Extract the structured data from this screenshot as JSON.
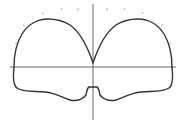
{
  "diagram": {
    "type": "closed-curve-on-axes",
    "colors": {
      "background": "#ffffff",
      "curve": "#333333",
      "axes": "#555555",
      "ticks": "#9a9a9a"
    },
    "axes": {
      "vertical": {
        "x": 93,
        "y1": 4,
        "y2": 120
      },
      "horizontal": {
        "y": 67,
        "x1": 10,
        "x2": 176
      }
    },
    "curve_path": "M93,63 C88,48 80,32 70,25 C62,20 55,19 48,19 C38,19 28,24 22,34 C16,44 14,56 14,67 C13,76 13,85 17,88 C22,92 34,91 45,92 C56,93 63,98 70,100 C78,102 84,98 86,95 C87,91 87,88 89,87 L97,87 C99,88 99,91 100,95 C102,98 108,102 116,100 C123,98 130,93 141,92 C152,91 164,92 169,88 C173,85 173,76 172,67 C172,56 170,44 164,34 C158,24 148,19 138,19 C131,19 124,20 116,25 C106,32 98,48 93,63 Z",
    "ticks": [
      {
        "x1": 15,
        "y1": 44,
        "x2": 17,
        "y2": 43
      },
      {
        "x1": 23,
        "y1": 25,
        "x2": 25,
        "y2": 26
      },
      {
        "x1": 42,
        "y1": 13,
        "x2": 44,
        "y2": 14
      },
      {
        "x1": 61,
        "y1": 8,
        "x2": 62,
        "y2": 10
      },
      {
        "x1": 78,
        "y1": 8,
        "x2": 78,
        "y2": 11
      },
      {
        "x1": 107,
        "y1": 8,
        "x2": 107,
        "y2": 11
      },
      {
        "x1": 124,
        "y1": 10,
        "x2": 125,
        "y2": 8
      },
      {
        "x1": 142,
        "y1": 14,
        "x2": 143,
        "y2": 12
      },
      {
        "x1": 161,
        "y1": 26,
        "x2": 163,
        "y2": 24
      },
      {
        "x1": 169,
        "y1": 43,
        "x2": 171,
        "y2": 44
      }
    ]
  }
}
